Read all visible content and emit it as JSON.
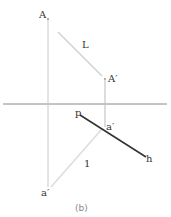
{
  "figure": {
    "caption": "(b)",
    "labels": {
      "A": "A",
      "A_prime": "A′",
      "L": "L",
      "p": "p",
      "a_prime_upper": "a′",
      "h": "h",
      "one": "1",
      "a_prime_lower": "a′"
    },
    "colors": {
      "axis": "#888888",
      "projector": "#c8c8c8",
      "light_line": "#d0d0d0",
      "ph_line": "#333333",
      "text": "#333333"
    }
  }
}
